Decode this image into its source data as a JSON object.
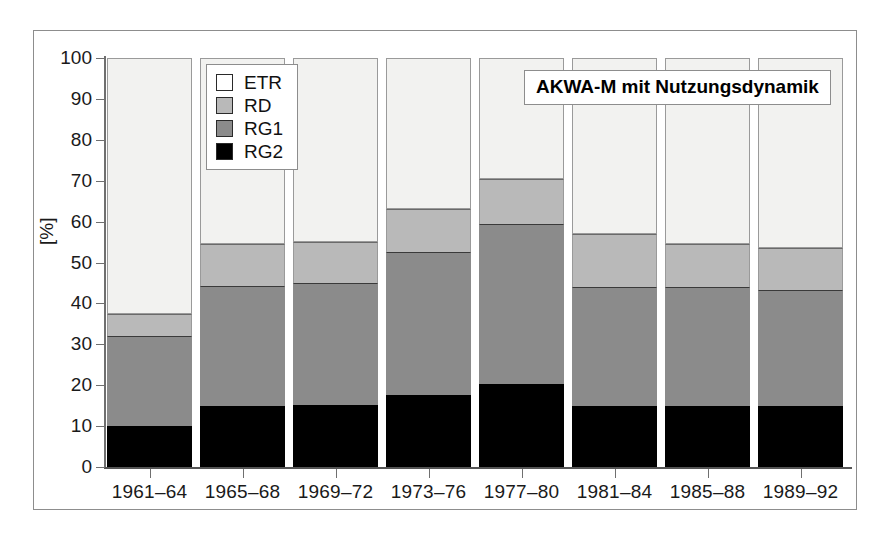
{
  "chart_data": {
    "type": "bar",
    "subtype": "stacked-100-percent",
    "title": "AKWA-M mit Nutzungsdynamik",
    "xlabel": "",
    "ylabel": "[%]",
    "ylim": [
      0,
      100
    ],
    "ytick_labels": [
      "100",
      "90",
      "80",
      "70",
      "60",
      "50",
      "40",
      "30",
      "20",
      "10",
      "0"
    ],
    "ytick_values": [
      100,
      90,
      80,
      70,
      60,
      50,
      40,
      30,
      20,
      10,
      0
    ],
    "grid": false,
    "legend_position": "top-left-inside",
    "stack_order_bottom_to_top": [
      "RG2",
      "RG1",
      "RD",
      "ETR"
    ],
    "categories": [
      "1961-64",
      "1965-68",
      "1969-72",
      "1973-76",
      "1977-80",
      "1981-84",
      "1985-88",
      "1989-92"
    ],
    "category_labels": [
      "1961–64",
      "1965–68",
      "1969–72",
      "1973–76",
      "1977–80",
      "1981–84",
      "1985–88",
      "1989–92"
    ],
    "series": [
      {
        "name": "RG2",
        "color": "#000000",
        "values": [
          10.0,
          14.8,
          15.2,
          17.5,
          20.3,
          15.0,
          15.0,
          14.8
        ]
      },
      {
        "name": "RG1",
        "color": "#8b8b8b",
        "values": [
          22.0,
          29.5,
          29.8,
          35.0,
          39.2,
          29.0,
          29.0,
          28.5
        ]
      },
      {
        "name": "RD",
        "color": "#b9b9b9",
        "values": [
          5.5,
          10.2,
          10.0,
          10.5,
          11.0,
          13.0,
          10.5,
          10.2
        ]
      },
      {
        "name": "ETR",
        "color": "#f2f2f0",
        "values": [
          62.5,
          45.5,
          45.0,
          37.0,
          29.5,
          43.0,
          45.5,
          46.5
        ]
      }
    ],
    "cumulative_tops": {
      "RG2": [
        10.0,
        14.8,
        15.2,
        17.5,
        20.3,
        15.0,
        15.0,
        14.8
      ],
      "RG1": [
        32.0,
        44.3,
        45.0,
        52.5,
        59.5,
        44.0,
        44.0,
        43.3
      ],
      "RD": [
        37.5,
        54.5,
        55.0,
        63.0,
        70.5,
        57.0,
        54.5,
        53.5
      ],
      "ETR": [
        100,
        100,
        100,
        100,
        100,
        100,
        100,
        100
      ]
    }
  },
  "legend": {
    "items": [
      {
        "label": "ETR",
        "color": "#ffffff"
      },
      {
        "label": "RD",
        "color": "#b9b9b9"
      },
      {
        "label": "RG1",
        "color": "#8b8b8b"
      },
      {
        "label": "RG2",
        "color": "#000000"
      }
    ]
  },
  "title_box": {
    "text": "AKWA-M mit Nutzungsdynamik"
  },
  "axis": {
    "y_unit_label": "[%]"
  }
}
